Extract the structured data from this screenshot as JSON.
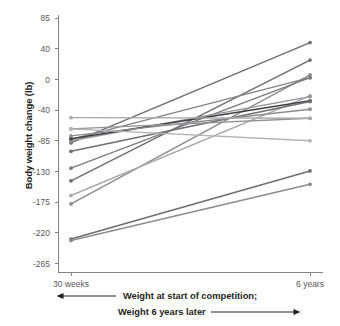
{
  "chart_data": {
    "type": "line",
    "subtype": "slope-chart",
    "title": "",
    "xlabel": "",
    "ylabel": "Body weight change (lb)",
    "x": [
      "30 weeks",
      "6 years"
    ],
    "xtick_labels": [
      "30 weeks",
      "6 years"
    ],
    "ytick_labels": [
      "85",
      "40",
      "0",
      "-40",
      "-85",
      "-130",
      "-175",
      "-220",
      "-265"
    ],
    "ytick_values": [
      85,
      40,
      0,
      -40,
      -85,
      -130,
      -175,
      -220,
      -265
    ],
    "ylim": [
      -265,
      85
    ],
    "grid": false,
    "legend": false,
    "legend_position": "none",
    "markers": "circle",
    "series": [
      {
        "name": "participant-1",
        "values": [
          -93,
          50
        ],
        "color": "#6d6e71"
      },
      {
        "name": "participant-2",
        "values": [
          -147,
          25
        ],
        "color": "#6d6e71"
      },
      {
        "name": "participant-3",
        "values": [
          -180,
          4
        ],
        "color": "#8c8c8e"
      },
      {
        "name": "participant-4",
        "values": [
          -88,
          0
        ],
        "color": "#828386"
      },
      {
        "name": "participant-5",
        "values": [
          -129,
          0
        ],
        "color": "#7b7c7f"
      },
      {
        "name": "participant-6",
        "values": [
          -168,
          -26
        ],
        "color": "#a7a9ac"
      },
      {
        "name": "participant-7",
        "values": [
          -90,
          -27
        ],
        "color": "#949699"
      },
      {
        "name": "participant-8",
        "values": [
          -87,
          -33
        ],
        "color": "#3f4043"
      },
      {
        "name": "participant-9",
        "values": [
          -105,
          -34
        ],
        "color": "#6d6e71"
      },
      {
        "name": "participant-10",
        "values": [
          -83,
          -45
        ],
        "color": "#8c8c8e"
      },
      {
        "name": "participant-11",
        "values": [
          -73,
          -58
        ],
        "color": "#939598"
      },
      {
        "name": "participant-12",
        "values": [
          -57,
          -58
        ],
        "color": "#a7a9ac"
      },
      {
        "name": "participant-13",
        "values": [
          -73,
          -90
        ],
        "color": "#b1b3b6"
      },
      {
        "name": "participant-14",
        "values": [
          -230,
          -133
        ],
        "color": "#6d6e71"
      },
      {
        "name": "participant-15",
        "values": [
          -232,
          -152
        ],
        "color": "#8c8c8e"
      }
    ],
    "annotations": [
      {
        "name": "caption-line-1",
        "text": "Weight at start of competition;",
        "arrow": "left"
      },
      {
        "name": "caption-line-2",
        "text": "Weight 6 years later",
        "arrow": "right"
      }
    ],
    "colors": {
      "axis": "#808285",
      "tick_text": "#58595b",
      "label_text": "#231f20"
    }
  },
  "axis": {
    "y_title": "Body weight change (lb)",
    "y_ticks": [
      "85",
      "40",
      "0",
      "-40",
      "-85",
      "-130",
      "-175",
      "-220",
      "-265"
    ],
    "x_ticks": [
      "30 weeks",
      "6 years"
    ]
  },
  "caption": {
    "line1": "Weight at start of competition;",
    "line2": "Weight 6 years later"
  }
}
